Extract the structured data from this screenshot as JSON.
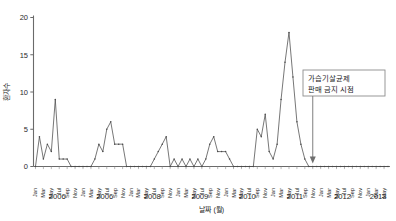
{
  "chart_data": {
    "type": "line",
    "title": "",
    "subtitle": "",
    "xlabel": "날짜 (월)",
    "ylabel": "환자수",
    "ylim": [
      0,
      20
    ],
    "yticks": [
      0,
      5,
      10,
      15,
      20
    ],
    "ytick_labels": [
      "0",
      "5",
      "10",
      "15",
      "20"
    ],
    "grid": false,
    "legend_position": "none",
    "marker": "small-dot",
    "line_color": "#4a4a4a",
    "axis_color": "#6a6a6a",
    "month_tick_labels": [
      "Jan",
      "Mar",
      "May",
      "Jul",
      "Sep",
      "Nov"
    ],
    "year_labels": [
      "2006",
      "2006",
      "2008",
      "2009",
      "2010",
      "2011",
      "2012",
      "2013"
    ],
    "annotations": [
      {
        "name": "ban-annotation",
        "text_line1": "가습기살균제",
        "text_line2": "판매 금지 시점",
        "arrow": "down"
      }
    ],
    "x": [
      "2006-01",
      "2006-02",
      "2006-03",
      "2006-04",
      "2006-05",
      "2006-06",
      "2006-07",
      "2006-08",
      "2006-09",
      "2006-10",
      "2006-11",
      "2006-12",
      "2007-01",
      "2007-02",
      "2007-03",
      "2007-04",
      "2007-05",
      "2007-06",
      "2007-07",
      "2007-08",
      "2007-09",
      "2007-10",
      "2007-11",
      "2007-12",
      "2008-01",
      "2008-02",
      "2008-03",
      "2008-04",
      "2008-05",
      "2008-06",
      "2008-07",
      "2008-08",
      "2008-09",
      "2008-10",
      "2008-11",
      "2008-12",
      "2009-01",
      "2009-02",
      "2009-03",
      "2009-04",
      "2009-05",
      "2009-06",
      "2009-07",
      "2009-08",
      "2009-09",
      "2009-10",
      "2009-11",
      "2009-12",
      "2010-01",
      "2010-02",
      "2010-03",
      "2010-04",
      "2010-05",
      "2010-06",
      "2010-07",
      "2010-08",
      "2010-09",
      "2010-10",
      "2010-11",
      "2010-12",
      "2011-01",
      "2011-02",
      "2011-03",
      "2011-04",
      "2011-05",
      "2011-06",
      "2011-07",
      "2011-08",
      "2011-09",
      "2011-10",
      "2011-11",
      "2011-12",
      "2012-01",
      "2012-02",
      "2012-03",
      "2012-04",
      "2012-05",
      "2012-06",
      "2012-07",
      "2012-08",
      "2012-09",
      "2012-10",
      "2012-11",
      "2012-12",
      "2013-01",
      "2013-02",
      "2013-03",
      "2013-04",
      "2013-05",
      "2013-06"
    ],
    "values": [
      0,
      4,
      1,
      3,
      2,
      9,
      1,
      1,
      1,
      0,
      0,
      0,
      0,
      0,
      0,
      1,
      3,
      2,
      5,
      6,
      3,
      3,
      3,
      0,
      0,
      0,
      0,
      0,
      0,
      0,
      1,
      2,
      3,
      4,
      0,
      1,
      0,
      1,
      0,
      1,
      0,
      1,
      0,
      1,
      3,
      4,
      2,
      2,
      2,
      1,
      0,
      0,
      0,
      0,
      0,
      0,
      5,
      4,
      7,
      2,
      1,
      3,
      9,
      14,
      18,
      12,
      6,
      3,
      1,
      0,
      0,
      0,
      0,
      0,
      0,
      0,
      0,
      0,
      0,
      0,
      0,
      0,
      0,
      0,
      0,
      0,
      0,
      0,
      0,
      0
    ],
    "ban_marker_x": "2011-11"
  }
}
